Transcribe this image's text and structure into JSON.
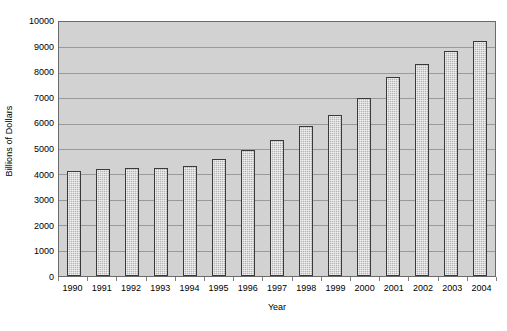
{
  "chart_data": {
    "type": "bar",
    "title": "",
    "xlabel": "Year",
    "ylabel": "Billions of Dollars",
    "categories": [
      "1990",
      "1991",
      "1992",
      "1993",
      "1994",
      "1995",
      "1996",
      "1997",
      "1998",
      "1999",
      "2000",
      "2001",
      "2002",
      "2003",
      "2004"
    ],
    "values": [
      4150,
      4200,
      4250,
      4250,
      4350,
      4600,
      4950,
      5350,
      5900,
      6350,
      7000,
      7850,
      8350,
      8850,
      9250
    ],
    "ylim": [
      0,
      10000
    ],
    "ytick_values": [
      0,
      1000,
      2000,
      3000,
      4000,
      5000,
      6000,
      7000,
      8000,
      9000,
      10000
    ],
    "ytick_labels": [
      "0",
      "1000",
      "2000",
      "3000",
      "4000",
      "5000",
      "6000",
      "7000",
      "8000",
      "9000",
      "10000"
    ],
    "grid": true,
    "legend": false,
    "series": [
      {
        "name": "Billions of Dollars",
        "values": [
          4150,
          4200,
          4250,
          4250,
          4350,
          4600,
          4950,
          5350,
          5900,
          6350,
          7000,
          7850,
          8350,
          8850,
          9250
        ]
      }
    ]
  },
  "style": {
    "plot_background": "#d2d2d2",
    "bar_fill": "#b5b5b5",
    "bar_border": "#3a3a3a",
    "gridline_color": "#9a9a9a",
    "axis_color": "#6b6b6b",
    "text_color": "#000000",
    "page_background": "#ffffff"
  }
}
